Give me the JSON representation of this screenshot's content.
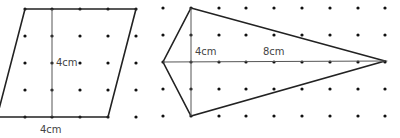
{
  "figures": [
    {
      "name": "parallelogram",
      "labels": {
        "height": "4cm",
        "base": "4cm"
      },
      "vertices": [
        [
          25,
          9
        ],
        [
          136,
          9
        ],
        [
          108,
          117
        ],
        [
          -3,
          117
        ]
      ],
      "height_line": [
        [
          52,
          9
        ],
        [
          52,
          117
        ]
      ],
      "dots": {
        "xs": [
          25,
          52,
          80,
          108,
          136
        ],
        "ys": [
          9,
          36,
          63,
          90,
          117
        ]
      }
    },
    {
      "name": "kite",
      "labels": {
        "short_diagonal_half": "4cm",
        "long_part": "8cm"
      },
      "vertices": [
        [
          191,
          8
        ],
        [
          385,
          61
        ],
        [
          191,
          116
        ],
        [
          163,
          62
        ]
      ],
      "vertical_diagonal": [
        [
          191,
          8
        ],
        [
          191,
          116
        ]
      ],
      "horizontal_diagonal": [
        [
          163,
          62
        ],
        [
          385,
          61
        ]
      ],
      "dots": {
        "xs": [
          163,
          191,
          219,
          246,
          274,
          302,
          330,
          358,
          385
        ],
        "ys": [
          8,
          35,
          62,
          89,
          116
        ]
      }
    }
  ],
  "colors": {
    "line": "#222222",
    "thin_line": "#555555",
    "dot": "#111111",
    "label": "#444444"
  }
}
